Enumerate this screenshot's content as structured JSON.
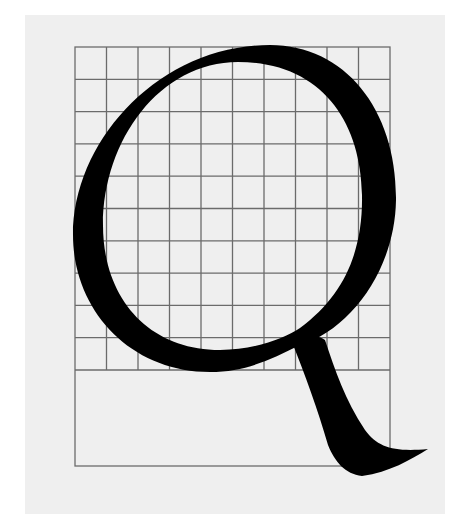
{
  "figure": {
    "glyph": "Q",
    "colors": {
      "background": "#ffffff",
      "paper": "#efefef",
      "grid_line": "#6b6b6b",
      "glyph": "#000000"
    },
    "grid": {
      "columns": 10,
      "rows": 10,
      "left": 75,
      "top": 47,
      "right": 390,
      "bottom": 370,
      "descender_box_bottom": 466
    }
  }
}
